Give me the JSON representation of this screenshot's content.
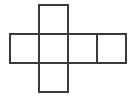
{
  "diagram": {
    "title": "",
    "type": "cube-net",
    "stroke_color": "#3a3a3a",
    "background": "#ffffff",
    "cell_size": 29,
    "squares": [
      {
        "id": "top",
        "x": 39,
        "y": 5
      },
      {
        "id": "left",
        "x": 10,
        "y": 34
      },
      {
        "id": "center",
        "x": 39,
        "y": 34
      },
      {
        "id": "right",
        "x": 68,
        "y": 34
      },
      {
        "id": "far-right",
        "x": 97,
        "y": 34
      },
      {
        "id": "bottom",
        "x": 39,
        "y": 63
      }
    ]
  }
}
